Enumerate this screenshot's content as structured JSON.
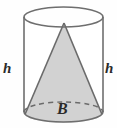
{
  "figure": {
    "type": "geometry-solid-diagram",
    "shapes": {
      "cylinder": {
        "name": "cylinder",
        "fill": "none",
        "stroke": "#6e6e6e",
        "left_x": 24,
        "right_x": 103,
        "top_center_y": 17,
        "bottom_center_y": 112,
        "radius_x": 39.5,
        "radius_y": 10
      },
      "cone": {
        "name": "cone",
        "fill": "#d2d2d2",
        "stroke": "#6b6b6b",
        "apex_x": 64,
        "apex_y": 23,
        "base_center_y": 112
      },
      "hidden_base_arc": {
        "name": "dashed-back-arc",
        "style": "dashed",
        "stroke": "#6b6b6b"
      }
    },
    "labels": {
      "height_left": "h",
      "height_right": "h",
      "base_area": "B"
    },
    "colors": {
      "cone_fill": "#d2d2d2",
      "base_fill": "#cfcfcf",
      "outline": "#6e6e6e",
      "label_text": "#2b2b2b",
      "background": "#fefefe"
    }
  }
}
